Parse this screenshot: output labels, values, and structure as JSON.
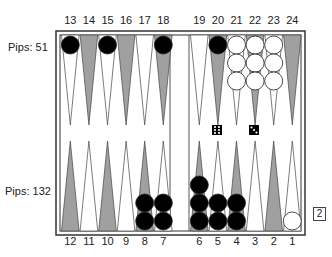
{
  "game": "backgammon",
  "top_player": {
    "label": "Pips: 51",
    "pips": 51
  },
  "bottom_player": {
    "label": "Pips: 132",
    "pips": 132
  },
  "top_point_labels": [
    "13",
    "14",
    "15",
    "16",
    "17",
    "18",
    "19",
    "20",
    "21",
    "22",
    "23",
    "24"
  ],
  "bottom_point_labels": [
    "12",
    "11",
    "10",
    "9",
    "8",
    "7",
    "6",
    "5",
    "4",
    "3",
    "2",
    "1"
  ],
  "checkers": [
    {
      "point": 13,
      "color": "black",
      "count": 1
    },
    {
      "point": 15,
      "color": "black",
      "count": 1
    },
    {
      "point": 18,
      "color": "black",
      "count": 1
    },
    {
      "point": 20,
      "color": "black",
      "count": 1
    },
    {
      "point": 21,
      "color": "white",
      "count": 3
    },
    {
      "point": 22,
      "color": "white",
      "count": 3
    },
    {
      "point": 23,
      "color": "white",
      "count": 3
    },
    {
      "point": 8,
      "color": "black",
      "count": 2
    },
    {
      "point": 7,
      "color": "black",
      "count": 2
    },
    {
      "point": 6,
      "color": "black",
      "count": 3
    },
    {
      "point": 5,
      "color": "black",
      "count": 2
    },
    {
      "point": 4,
      "color": "black",
      "count": 2
    },
    {
      "point": 1,
      "color": "white",
      "count": 1
    }
  ],
  "dice": [
    6,
    3
  ],
  "doubling_cube": "2",
  "colors": {
    "dark_point": "#a0a0a0",
    "light_point": "#ffffff",
    "black_checker": "#000000",
    "white_checker": "#ffffff",
    "frame": "#333333"
  }
}
